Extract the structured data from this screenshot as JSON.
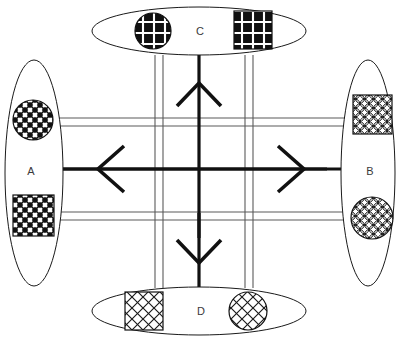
{
  "diagram": {
    "canvas": {
      "width": 396,
      "height": 343,
      "background": "#ffffff"
    },
    "colors": {
      "outline": "#1a1a1a",
      "road": "#5a5a5a",
      "arrow": "#111111",
      "label": "#3a3a3a",
      "fill": "#ffffff"
    },
    "zones": [
      {
        "id": "zone-a",
        "label": "A",
        "position": "left",
        "orientation": "vertical",
        "center": {
          "x": 34,
          "y": 173
        },
        "radius": {
          "x": 29,
          "y": 113
        },
        "label_point": {
          "x": 31,
          "y": 172
        },
        "markers": [
          {
            "shape": "circle",
            "pattern": "dense-basketweave",
            "cx": 33,
            "cy": 120,
            "r": 20
          },
          {
            "shape": "square",
            "pattern": "dense-basketweave",
            "x": 13,
            "y": 195,
            "size": 41
          }
        ]
      },
      {
        "id": "zone-b",
        "label": "B",
        "position": "right",
        "orientation": "vertical",
        "center": {
          "x": 368,
          "y": 173
        },
        "radius": {
          "x": 27,
          "y": 113
        },
        "label_point": {
          "x": 370,
          "y": 172
        },
        "markers": [
          {
            "shape": "square",
            "pattern": "circle-lattice",
            "x": 353,
            "y": 95,
            "size": 39
          },
          {
            "shape": "circle",
            "pattern": "circle-lattice",
            "cx": 372,
            "cy": 218,
            "r": 21
          }
        ]
      },
      {
        "id": "zone-c",
        "label": "C",
        "position": "top",
        "orientation": "horizontal",
        "center": {
          "x": 199,
          "y": 31
        },
        "radius": {
          "x": 107,
          "y": 24
        },
        "label_point": {
          "x": 200,
          "y": 32
        },
        "markers": [
          {
            "shape": "circle",
            "pattern": "diamond-grid-dark",
            "cx": 153,
            "cy": 31,
            "r": 18
          },
          {
            "shape": "square",
            "pattern": "diamond-grid-dark",
            "x": 234,
            "y": 11,
            "size": 38
          }
        ]
      },
      {
        "id": "zone-d",
        "label": "D",
        "position": "bottom",
        "orientation": "horizontal",
        "center": {
          "x": 199,
          "y": 311
        },
        "radius": {
          "x": 107,
          "y": 24
        },
        "label_point": {
          "x": 201,
          "y": 312
        },
        "markers": [
          {
            "shape": "square",
            "pattern": "light-basketweave",
            "x": 125,
            "y": 292,
            "size": 38
          },
          {
            "shape": "circle",
            "pattern": "light-basketweave",
            "cx": 248,
            "cy": 311,
            "r": 19
          }
        ]
      }
    ],
    "roads": [
      {
        "id": "road-horizontal-upper",
        "axis": "horizontal",
        "lane_y": [
          118,
          126
        ],
        "x_start": 58,
        "x_end": 345
      },
      {
        "id": "road-horizontal-lower",
        "axis": "horizontal",
        "lane_y": [
          212,
          220
        ],
        "x_start": 58,
        "x_end": 345
      },
      {
        "id": "road-vertical-left",
        "axis": "vertical",
        "lane_x": [
          155,
          163
        ],
        "y_start": 55,
        "y_end": 288
      },
      {
        "id": "road-vertical-right",
        "axis": "vertical",
        "lane_x": [
          245,
          253
        ],
        "y_start": 55,
        "y_end": 288
      }
    ],
    "flows": [
      {
        "id": "flow-west",
        "direction": "west",
        "label_target": "A",
        "shaft": {
          "x1": 327,
          "y1": 169,
          "x2": 58,
          "y2": 169
        },
        "head_at": {
          "x": 98,
          "y": 169
        }
      },
      {
        "id": "flow-east",
        "direction": "east",
        "label_target": "B",
        "shaft": {
          "x1": 60,
          "y1": 169,
          "x2": 345,
          "y2": 169
        },
        "head_at": {
          "x": 304,
          "y": 169
        }
      },
      {
        "id": "flow-north",
        "direction": "north",
        "label_target": "C",
        "shaft": {
          "x1": 199,
          "y1": 238,
          "x2": 199,
          "y2": 55
        },
        "head_at": {
          "x": 199,
          "y": 83
        }
      },
      {
        "id": "flow-south",
        "direction": "south",
        "label_target": "D",
        "shaft": {
          "x1": 199,
          "y1": 218,
          "x2": 199,
          "y2": 289
        },
        "head_at": {
          "x": 199,
          "y": 263
        }
      }
    ]
  }
}
